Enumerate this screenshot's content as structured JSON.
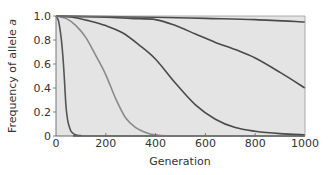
{
  "chart_data": {
    "type": "line",
    "title": "",
    "xlabel": "Generation",
    "ylabel_prefix": "Frequency of allele ",
    "ylabel_italic": "a",
    "xlim": [
      0,
      1000
    ],
    "ylim": [
      0,
      1.0
    ],
    "xticks": [
      0,
      200,
      400,
      600,
      800,
      1000
    ],
    "xtick_labels": [
      "0",
      "200",
      "400",
      "600",
      "800",
      "1000"
    ],
    "yticks": [
      0,
      0.2,
      0.4,
      0.6,
      0.8,
      1.0
    ],
    "ytick_labels": [
      "0",
      "0.2",
      "0.4",
      "0.6",
      "0.8",
      "1.0"
    ],
    "grid": false,
    "legend": null,
    "plot_background": "#e4e4e4",
    "series": [
      {
        "name": "curve-1-fastest",
        "color": "#555555",
        "x": [
          0,
          10,
          20,
          27,
          33,
          40,
          47,
          53,
          60,
          70,
          80,
          100,
          150,
          1000
        ],
        "y": [
          1.0,
          0.96,
          0.83,
          0.68,
          0.5,
          0.25,
          0.13,
          0.08,
          0.04,
          0.02,
          0.01,
          0.003,
          0.0,
          0.0
        ]
      },
      {
        "name": "curve-2",
        "color": "#8a8a8a",
        "x": [
          0,
          40,
          80,
          120,
          160,
          200,
          240,
          280,
          320,
          360,
          400,
          500,
          1000
        ],
        "y": [
          1.0,
          0.98,
          0.92,
          0.82,
          0.67,
          0.51,
          0.31,
          0.15,
          0.07,
          0.03,
          0.01,
          0.0,
          0.0
        ]
      },
      {
        "name": "curve-3",
        "color": "#4a4a4a",
        "x": [
          0,
          67,
          133,
          200,
          267,
          333,
          400,
          480,
          560,
          640,
          720,
          800,
          900,
          1000
        ],
        "y": [
          1.0,
          0.99,
          0.96,
          0.92,
          0.86,
          0.76,
          0.64,
          0.44,
          0.26,
          0.14,
          0.07,
          0.04,
          0.02,
          0.01
        ]
      },
      {
        "name": "curve-4",
        "color": "#4a4a4a",
        "x": [
          0,
          100,
          200,
          300,
          400,
          480,
          560,
          640,
          720,
          800,
          900,
          1000
        ],
        "y": [
          1.0,
          0.995,
          0.99,
          0.98,
          0.97,
          0.92,
          0.85,
          0.78,
          0.72,
          0.65,
          0.53,
          0.4
        ]
      },
      {
        "name": "curve-5-slowest",
        "color": "#4a4a4a",
        "x": [
          0,
          200,
          400,
          600,
          800,
          1000
        ],
        "y": [
          1.0,
          0.995,
          0.99,
          0.98,
          0.97,
          0.95
        ]
      }
    ]
  }
}
